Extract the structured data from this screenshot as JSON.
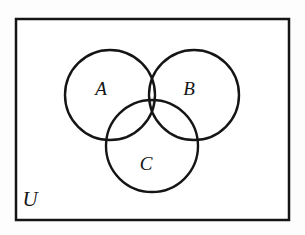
{
  "figure": {
    "type": "venn-diagram",
    "background_color": "#fdfdfd",
    "stroke_color": "#151515",
    "shaded_color": "#dcdcdc",
    "shaded_region": "A-and-B-and-C",
    "shaded_region_label": "A ∩ B ∩ C"
  },
  "universe": {
    "label": "U",
    "rect": {
      "x": 16,
      "y": 19,
      "width": 273,
      "height": 201
    },
    "stroke_width": 2.5,
    "label_position": {
      "x": 30,
      "y": 206
    }
  },
  "sets": [
    {
      "id": "A",
      "label": "A",
      "cx": 110,
      "cy": 95,
      "r": 45,
      "label_position": {
        "x": 101,
        "y": 95
      }
    },
    {
      "id": "B",
      "label": "B",
      "cx": 194,
      "cy": 95,
      "r": 45,
      "label_position": {
        "x": 189,
        "y": 95
      }
    },
    {
      "id": "C",
      "label": "C",
      "cx": 152,
      "cy": 146,
      "r": 46,
      "label_position": {
        "x": 146,
        "y": 170
      }
    }
  ],
  "chart_data": {
    "type": "diagram",
    "sets": [
      "A",
      "B",
      "C"
    ],
    "universe": "U",
    "shaded_regions": [
      "A ∩ B ∩ C"
    ],
    "unshaded_regions": [
      "A only",
      "B only",
      "C only",
      "A ∩ B only",
      "A ∩ C only",
      "B ∩ C only",
      "U outside A ∪ B ∪ C"
    ],
    "legend": [],
    "grid": false
  }
}
